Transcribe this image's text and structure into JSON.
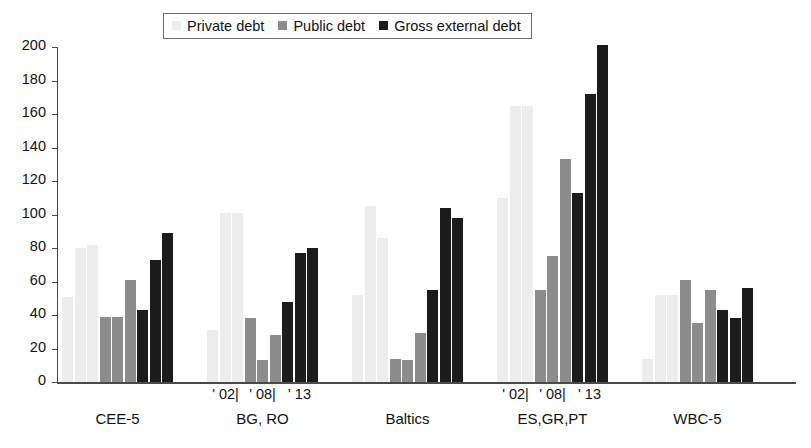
{
  "chart_data": {
    "type": "bar",
    "title": "",
    "xlabel": "",
    "ylabel": "",
    "ylim": [
      0,
      200
    ],
    "yticks": [
      0,
      20,
      40,
      60,
      80,
      100,
      120,
      140,
      160,
      180,
      200
    ],
    "grid": false,
    "legend_position": "top-center",
    "legend": [
      "Private debt",
      "Public debt",
      "Gross external debt"
    ],
    "series_colors": {
      "private_debt": "#ededed",
      "public_debt": "#8c8c8c",
      "gross_external_debt": "#1c1c1c"
    },
    "groups": [
      "CEE-5",
      "BG, RO",
      "Baltics",
      "ES,GR,PT",
      "WBC-5"
    ],
    "years": [
      "' 02|",
      "' 08|",
      "' 13"
    ],
    "year_axis_note": "' 02| ' 08| ' 13",
    "series": [
      {
        "name": "Private debt",
        "values_by_group": {
          "CEE-5": [
            51,
            80,
            82
          ],
          "BG, RO": [
            31,
            101,
            101
          ],
          "Baltics": [
            52,
            105,
            86
          ],
          "ES,GR,PT": [
            110,
            165,
            165
          ],
          "WBC-5": [
            14,
            52,
            52
          ]
        }
      },
      {
        "name": "Public debt",
        "values_by_group": {
          "CEE-5": [
            39,
            39,
            61
          ],
          "BG, RO": [
            38,
            13,
            28
          ],
          "Baltics": [
            14,
            13,
            29
          ],
          "ES,GR,PT": [
            55,
            75,
            133
          ],
          "WBC-5": [
            61,
            35,
            55
          ]
        }
      },
      {
        "name": "Gross external debt",
        "values_by_group": {
          "CEE-5": [
            43,
            73,
            89
          ],
          "BG, RO": [
            48,
            77,
            80
          ],
          "Baltics": [
            55,
            104,
            98
          ],
          "ES,GR,PT": [
            113,
            172,
            201
          ],
          "WBC-5": [
            43,
            38,
            56
          ]
        }
      }
    ]
  },
  "legend": {
    "items": [
      {
        "label": "Private debt",
        "swatch": "private-debt-swatch-icon",
        "color": "#ededed"
      },
      {
        "label": "Public debt",
        "swatch": "public-debt-swatch-icon",
        "color": "#8c8c8c"
      },
      {
        "label": "Gross external debt",
        "swatch": "gross-external-debt-swatch-icon",
        "color": "#1c1c1c"
      }
    ]
  },
  "axis": {
    "y_tick_labels": [
      "200",
      "180",
      "160",
      "140",
      "120",
      "100",
      "80",
      "60",
      "40",
      "20",
      "0"
    ]
  },
  "categories": {
    "groups": [
      {
        "label": "CEE-5",
        "show_years": false
      },
      {
        "label": "BG, RO",
        "show_years": true
      },
      {
        "label": "Baltics",
        "show_years": false
      },
      {
        "label": "ES,GR,PT",
        "show_years": true
      },
      {
        "label": "WBC-5",
        "show_years": false
      }
    ],
    "year_labels": [
      "' 02|",
      "' 08|",
      "' 13"
    ]
  }
}
